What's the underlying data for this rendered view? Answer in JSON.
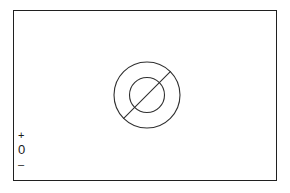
{
  "figure": {
    "background_color": "#ffffff",
    "line_color": "#202020",
    "width": 290,
    "height": 193
  },
  "frame": {
    "name": "diagram border",
    "stroke_color": "#202020",
    "stroke_width": 1.5,
    "x": 13,
    "y": 10,
    "width": 264,
    "height": 171
  },
  "symbol": {
    "name": "concentric circles with diagonal slash",
    "stroke_color": "#303030",
    "center_x": 146,
    "center_y": 94,
    "outer_radius": 33,
    "inner_radius": 17.5,
    "diagonal_angle_degrees": 45,
    "diagonal": {
      "x1": 122,
      "y1": 118,
      "x2": 170,
      "y2": 70
    }
  },
  "polarity_scale": {
    "name": "polarity scale",
    "orientation": "vertical",
    "marks": [
      {
        "id": "plus",
        "label": "+"
      },
      {
        "id": "zero",
        "label": "0"
      },
      {
        "id": "minus",
        "label": "–"
      }
    ]
  }
}
